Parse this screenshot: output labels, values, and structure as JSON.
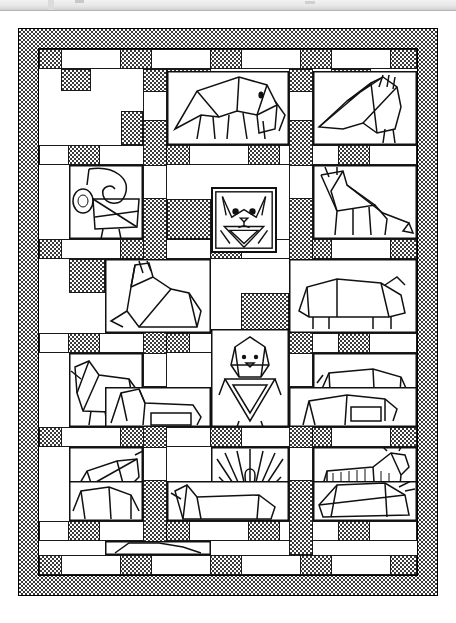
{
  "page": {
    "background_color": "#ffffff",
    "ink_color": "#111111",
    "top_bar_color": "#e6e6e6"
  },
  "figure": {
    "name": "animal-patchwork-quilt",
    "title": "Animal Patchwork Quilt",
    "style": "black-and-white line drawing",
    "width_px": 420,
    "height_px": 568
  },
  "quilt": {
    "border": {
      "name": "pieced-checkerboard-border",
      "fabric": "fine checkered print",
      "fill_color": "#3a3a3a",
      "thickness_px": 19
    },
    "sashing": {
      "name": "nine-patch-sashing",
      "pattern": "alternating dark checkered and light squares",
      "dark_color": "#3a3a3a",
      "light_color": "#ffffff"
    },
    "grid": {
      "columns": 3,
      "rows": 5,
      "total_animal_blocks": 14
    },
    "blocks": [
      {
        "row": 1,
        "col": 1,
        "animal": "empty-patch",
        "label": ""
      },
      {
        "row": 1,
        "col": 2,
        "animal": "elephant",
        "label": "Elephant"
      },
      {
        "row": 1,
        "col": 3,
        "animal": "bird",
        "label": "Bird"
      },
      {
        "row": 2,
        "col": 1,
        "animal": "monkey",
        "label": "Monkey"
      },
      {
        "row": 2,
        "col": 2,
        "animal": "cat",
        "label": "Cat"
      },
      {
        "row": 2,
        "col": 3,
        "animal": "giraffe",
        "label": "Giraffe"
      },
      {
        "row": 3,
        "col": 1,
        "animal": "kangaroo",
        "label": "Kangaroo"
      },
      {
        "row": 3,
        "col": 2,
        "animal": "hippo",
        "label": "Hippopotamus"
      },
      {
        "row": 3,
        "col": 3,
        "animal": "empty-patch",
        "label": ""
      },
      {
        "row": 4,
        "col": 1,
        "animal": "dog",
        "label": "Dog"
      },
      {
        "row": 4,
        "col": 2,
        "animal": "lion",
        "label": "Lion"
      },
      {
        "row": 4,
        "col": 3,
        "animal": "pig",
        "label": "Pig"
      },
      {
        "row": 5,
        "col": 1,
        "animal": "cow",
        "label": "Cow"
      },
      {
        "row": 5,
        "col": 2,
        "animal": "ostrich",
        "label": "Ostrich"
      },
      {
        "row": 6,
        "col": 1,
        "animal": "swan",
        "label": "Swan"
      },
      {
        "row": 6,
        "col": 2,
        "animal": "peacock",
        "label": "Peacock"
      },
      {
        "row": 6,
        "col": 3,
        "animal": "zebra",
        "label": "Zebra"
      },
      {
        "row": 7,
        "col": 1,
        "animal": "fox",
        "label": "Fox"
      },
      {
        "row": 7,
        "col": 2,
        "animal": "bull",
        "label": "Bull"
      }
    ]
  }
}
